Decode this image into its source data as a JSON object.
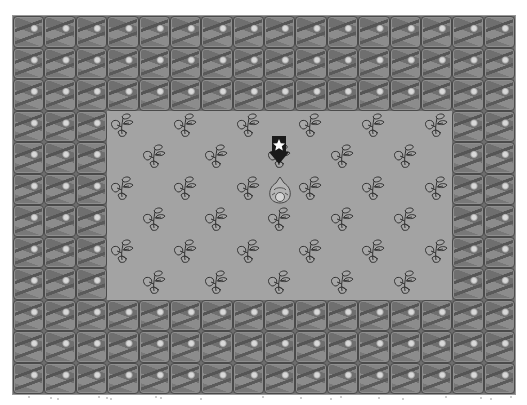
{
  "game": {
    "grid": {
      "cols": 16,
      "rows": 12
    },
    "floor_region": {
      "col_start": 3,
      "col_end": 13,
      "row_start": 3,
      "row_end": 8
    },
    "tiles": {
      "wall": "rock-wall",
      "floor": "grass-floor",
      "object": "plant"
    },
    "plants": [
      [
        3,
        3
      ],
      [
        3,
        5
      ],
      [
        3,
        7
      ],
      [
        3,
        9
      ],
      [
        3,
        11
      ],
      [
        3,
        13
      ],
      [
        4,
        4
      ],
      [
        4,
        6
      ],
      [
        4,
        8
      ],
      [
        4,
        10
      ],
      [
        4,
        12
      ],
      [
        5,
        3
      ],
      [
        5,
        5
      ],
      [
        5,
        7
      ],
      [
        5,
        9
      ],
      [
        5,
        11
      ],
      [
        5,
        13
      ],
      [
        6,
        4
      ],
      [
        6,
        6
      ],
      [
        6,
        8
      ],
      [
        6,
        10
      ],
      [
        6,
        12
      ],
      [
        7,
        3
      ],
      [
        7,
        5
      ],
      [
        7,
        7
      ],
      [
        7,
        9
      ],
      [
        7,
        11
      ],
      [
        7,
        13
      ],
      [
        8,
        4
      ],
      [
        8,
        6
      ],
      [
        8,
        8
      ],
      [
        8,
        10
      ],
      [
        8,
        12
      ]
    ],
    "agent": {
      "row": 5,
      "col": 8,
      "sprite": "player-character"
    },
    "target_marker": {
      "row": 4,
      "col": 8,
      "icon": "down-arrow-star-icon"
    },
    "colors": {
      "wall": "#7a7a7a",
      "wall_border": "#4a4a4a",
      "floor": "#a3a3a3",
      "outline": "#333333",
      "background": "#ffffff"
    }
  }
}
